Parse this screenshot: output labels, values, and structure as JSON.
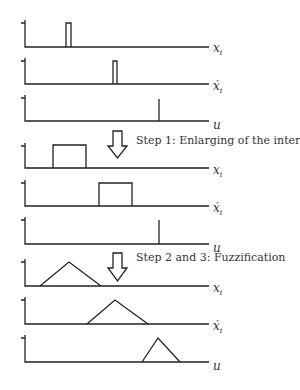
{
  "figure": {
    "steps": [
      {
        "label": "Step 1: Enlarging of the intervals"
      },
      {
        "label": "Step 2 and 3: Fuzzification"
      }
    ],
    "axis_labels": {
      "x": "x",
      "x_sub": "i",
      "xdot": "ẋ",
      "xdot_sub": "i",
      "u": "u"
    },
    "stages": [
      {
        "name": "crisp values",
        "plots": [
          {
            "variable": "x_i",
            "shape": "narrow pulse",
            "left": 66,
            "right": 71
          },
          {
            "variable": "xdot_i",
            "shape": "narrow pulse",
            "left": 113,
            "right": 117
          },
          {
            "variable": "u",
            "shape": "spike",
            "position": 159
          }
        ]
      },
      {
        "name": "enlarged intervals",
        "plots": [
          {
            "variable": "x_i",
            "shape": "interval",
            "left": 53,
            "right": 86
          },
          {
            "variable": "xdot_i",
            "shape": "interval",
            "left": 99,
            "right": 132
          },
          {
            "variable": "u",
            "shape": "spike",
            "position": 159
          }
        ]
      },
      {
        "name": "fuzzified",
        "plots": [
          {
            "variable": "x_i",
            "shape": "triangle",
            "left": 40,
            "peak": 69,
            "right": 101
          },
          {
            "variable": "xdot_i",
            "shape": "triangle",
            "left": 87,
            "peak": 115,
            "right": 148
          },
          {
            "variable": "u",
            "shape": "triangle",
            "left": 142,
            "peak": 158,
            "right": 180
          }
        ]
      }
    ]
  }
}
